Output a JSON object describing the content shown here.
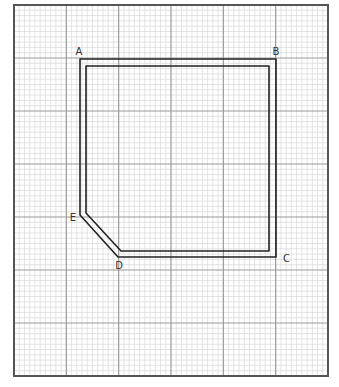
{
  "diagram": {
    "type": "grid-plan",
    "grid": {
      "x0": 14,
      "y0": 5,
      "x1": 328,
      "y1": 376,
      "major_cols": 6,
      "major_rows": 7,
      "minor_per_major": 10,
      "minor_color": "#d9d9d9",
      "major_color": "#9a9a9a",
      "border_color": "#555555"
    },
    "shape": {
      "outline_color": "#222222",
      "outer_path": [
        [
          80,
          59
        ],
        [
          276,
          59
        ],
        [
          276,
          257
        ],
        [
          118,
          257
        ],
        [
          80,
          215
        ]
      ],
      "inner_path": [
        [
          86,
          66
        ],
        [
          269,
          66
        ],
        [
          269,
          251
        ],
        [
          121,
          251
        ],
        [
          86,
          213
        ]
      ]
    },
    "points": [
      {
        "label": "A",
        "x": 79,
        "y": 55
      },
      {
        "label": "B",
        "x": 276,
        "y": 55
      },
      {
        "label": "C",
        "x": 283,
        "y": 262
      },
      {
        "label": "D",
        "x": 119,
        "y": 269
      },
      {
        "label": "E",
        "x": 73,
        "y": 221
      }
    ]
  }
}
